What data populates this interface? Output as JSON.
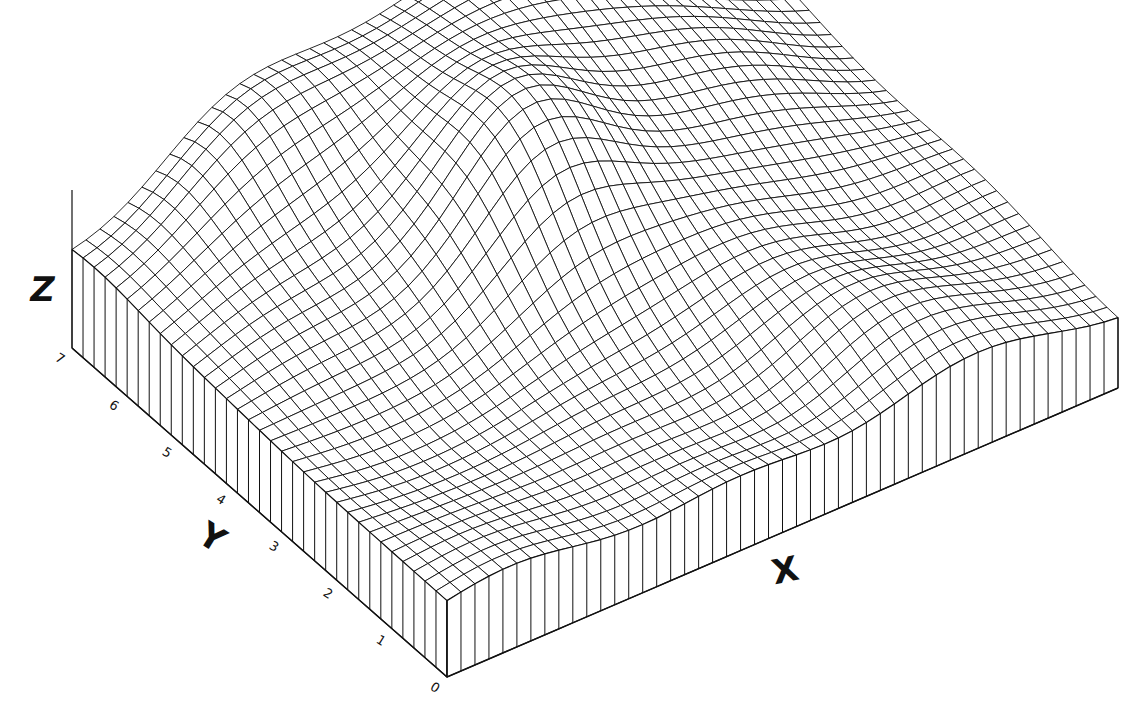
{
  "chart_data": {
    "type": "surface-3d-wireframe",
    "title": "",
    "xlabel": "X",
    "ylabel": "Y",
    "zlabel": "Z",
    "y_ticks": [
      "0",
      "1",
      "2",
      "3",
      "4",
      "5",
      "6",
      "7"
    ],
    "x_ticks": [],
    "z_ticks": [],
    "ylim": [
      0,
      7
    ],
    "xlim": [
      0,
      10
    ],
    "grid": false,
    "legend": null,
    "style": {
      "line_color": "#111111",
      "background": "#ffffff",
      "fill": "#ffffff"
    },
    "mesh": {
      "nx": 48,
      "ny": 34,
      "base_z": 0.0
    },
    "surface_description": "Wireframe heightfield on a block base: broad high dome toward back-right (x≈5.5,y≈6), secondary local peak near center (x≈4.5,y≈4.2), a ridge/plateau at back-left (x≈1.5,y≈6.5), valleys along the front-left; surface edges drawn as vertical skirt lines down to the base.",
    "surface_bumps": [
      {
        "cx": 5.6,
        "cy": 6.4,
        "amp": 3.6,
        "sx": 2.6,
        "sy": 2.4,
        "label": "main-dome"
      },
      {
        "cx": 4.6,
        "cy": 4.2,
        "amp": 1.5,
        "sx": 0.9,
        "sy": 0.8,
        "label": "center-peak"
      },
      {
        "cx": 2.0,
        "cy": 6.6,
        "amp": 1.3,
        "sx": 1.1,
        "sy": 0.8,
        "label": "back-left-ridge"
      },
      {
        "cx": 7.2,
        "cy": 1.0,
        "amp": 0.9,
        "sx": 1.0,
        "sy": 0.8,
        "label": "right-front-bump"
      },
      {
        "cx": 2.6,
        "cy": 2.6,
        "amp": -0.7,
        "sx": 1.0,
        "sy": 1.0,
        "label": "front-left-valley"
      },
      {
        "cx": 5.2,
        "cy": 0.8,
        "amp": -0.6,
        "sx": 1.2,
        "sy": 0.8,
        "label": "front-valley"
      }
    ],
    "base_height": 1.9
  },
  "labels": {
    "x_axis": "X",
    "y_axis": "Y",
    "z_axis": "Z"
  }
}
